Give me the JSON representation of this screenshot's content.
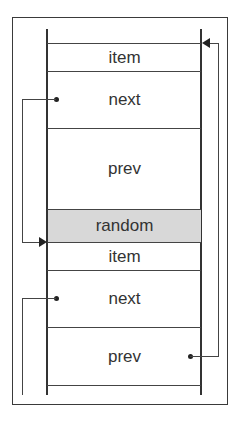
{
  "diagram": {
    "title": "",
    "node1": {
      "item": "item",
      "next": "next",
      "prev": "prev"
    },
    "random": "random",
    "node2": {
      "item": "item",
      "next": "next",
      "prev": "prev"
    },
    "colors": {
      "line": "#333333",
      "random_fill": "#d8d8d8",
      "text": "#333333"
    },
    "connections": [
      {
        "from": "node1.next",
        "to": "node2.item",
        "side": "left"
      },
      {
        "from": "node2.prev",
        "to": "node1.item",
        "side": "right"
      },
      {
        "from": "node2.next",
        "to": "offscreen-below",
        "side": "left"
      }
    ]
  }
}
